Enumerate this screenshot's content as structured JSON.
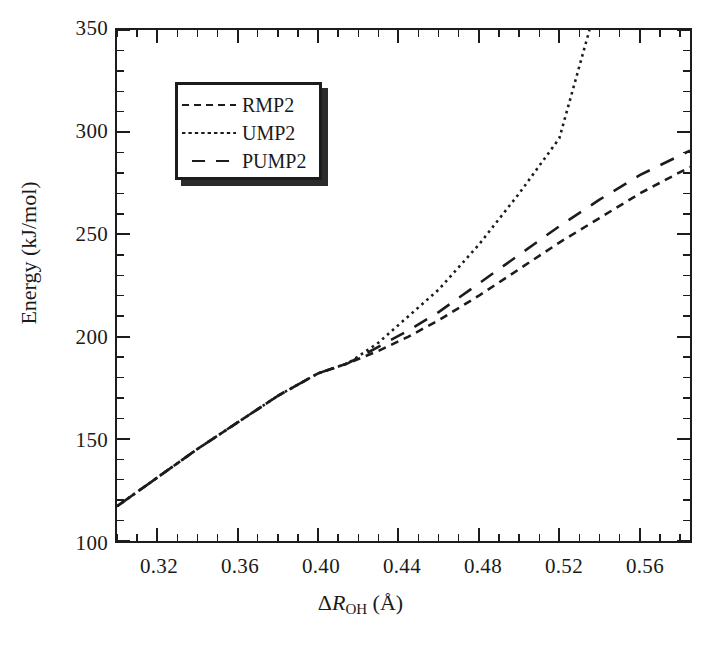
{
  "chart_data": {
    "type": "line",
    "title": "",
    "xlabel": "ΔR_OH (Å)",
    "ylabel": "Energy (kJ/mol)",
    "xlim": [
      0.3,
      0.585
    ],
    "ylim": [
      100,
      350
    ],
    "grid": false,
    "legend_position": "upper-left-inset",
    "x_major_ticks": [
      0.32,
      0.36,
      0.4,
      0.44,
      0.48,
      0.52,
      0.56
    ],
    "x_major_tick_labels": [
      "0.32",
      "0.36",
      "0.40",
      "0.44",
      "0.48",
      "0.52",
      "0.56"
    ],
    "x_minor_tick_step": 0.01,
    "y_major_ticks": [
      100,
      150,
      200,
      250,
      300,
      350
    ],
    "y_major_tick_labels": [
      "100",
      "150",
      "200",
      "250",
      "300",
      "350"
    ],
    "y_minor_tick_step": 10,
    "series": [
      {
        "name": "RMP2",
        "dash": "dashed",
        "x": [
          0.3,
          0.32,
          0.34,
          0.36,
          0.38,
          0.4,
          0.415,
          0.43,
          0.445,
          0.46,
          0.48,
          0.5,
          0.52,
          0.54,
          0.56,
          0.585
        ],
        "values": [
          117,
          131,
          145,
          158,
          171,
          182,
          187,
          193,
          200,
          208,
          220,
          233,
          246,
          258,
          270,
          283
        ]
      },
      {
        "name": "UMP2",
        "dash": "dotted",
        "x": [
          0.3,
          0.32,
          0.34,
          0.36,
          0.38,
          0.4,
          0.415,
          0.43,
          0.445,
          0.46,
          0.48,
          0.5,
          0.52,
          0.535
        ],
        "values": [
          117,
          131,
          145,
          158,
          171,
          182,
          187,
          197,
          210,
          223,
          245,
          270,
          297,
          350
        ]
      },
      {
        "name": "PUMP2",
        "dash": "longdash",
        "x": [
          0.3,
          0.32,
          0.34,
          0.36,
          0.38,
          0.4,
          0.415,
          0.43,
          0.445,
          0.46,
          0.48,
          0.5,
          0.52,
          0.54,
          0.56,
          0.585
        ],
        "values": [
          117,
          131,
          145,
          158,
          171,
          182,
          187,
          195,
          203,
          212,
          226,
          240,
          254,
          267,
          279,
          291
        ]
      }
    ]
  },
  "axes": {
    "ylabel_text": "Energy (kJ/mol)",
    "xlabel_prefix": "Δ",
    "xlabel_symbol": "R",
    "xlabel_subscript": "OH",
    "xlabel_unit": "(Å)"
  },
  "legend": {
    "items": [
      {
        "label": "RMP2",
        "style": "dashed"
      },
      {
        "label": "UMP2",
        "style": "dotted"
      },
      {
        "label": "PUMP2",
        "style": "longdash"
      }
    ]
  },
  "colors": {
    "line": "#1c1c1c",
    "frame": "#1c1c1c",
    "text": "#1a1a1a",
    "background": "#ffffff",
    "legend_shadow": "#2b2b2b"
  }
}
